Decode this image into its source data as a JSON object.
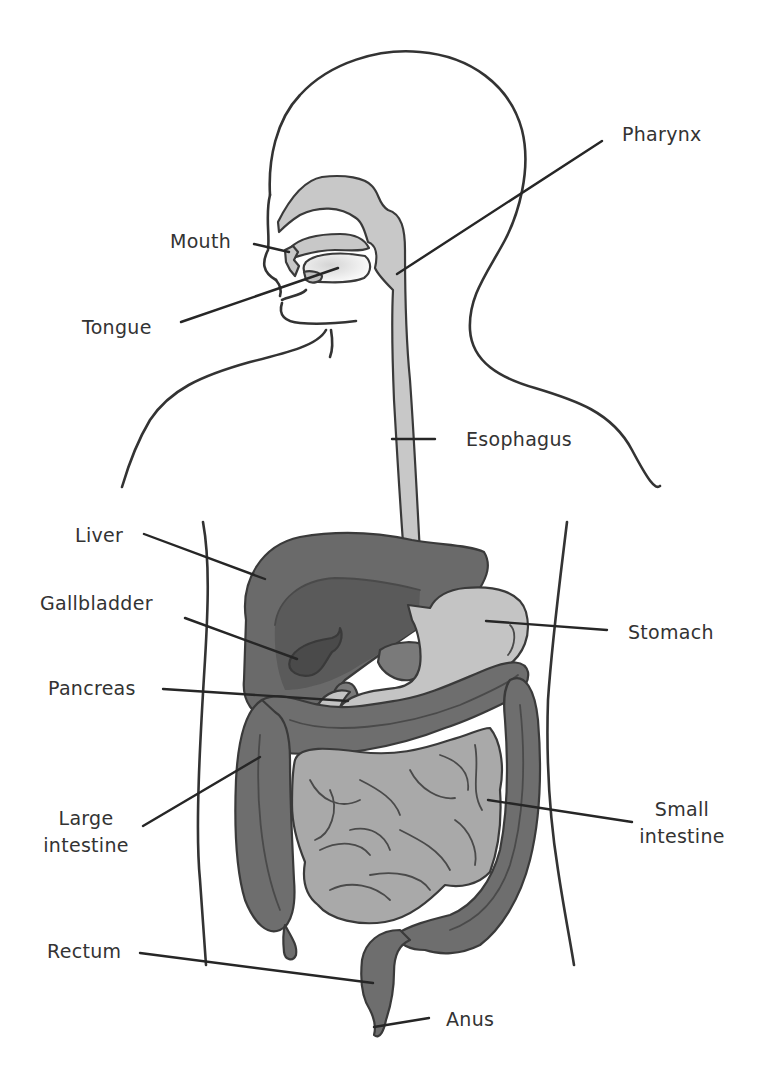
{
  "diagram": {
    "colors": {
      "background": "#ffffff",
      "outline": "#333333",
      "tract_light": "#c8c8c8",
      "stomach": "#c4c4c4",
      "small_intestine": "#a9a9a9",
      "large_intestine": "#6e6e6e",
      "liver": "#6a6a6a",
      "liver_inner": "#5a5a5a",
      "gallbladder": "#4a4a4a",
      "pancreas": "#7a7a7a",
      "label_text": "#333333"
    },
    "labels": {
      "pharynx": "Pharynx",
      "mouth": "Mouth",
      "tongue": "Tongue",
      "esophagus": "Esophagus",
      "liver": "Liver",
      "gallbladder": "Gallbladder",
      "stomach": "Stomach",
      "pancreas": "Pancreas",
      "large_intestine_1": "Large",
      "large_intestine_2": "intestine",
      "small_intestine_1": "Small",
      "small_intestine_2": "intestine",
      "rectum": "Rectum",
      "anus": "Anus"
    }
  }
}
